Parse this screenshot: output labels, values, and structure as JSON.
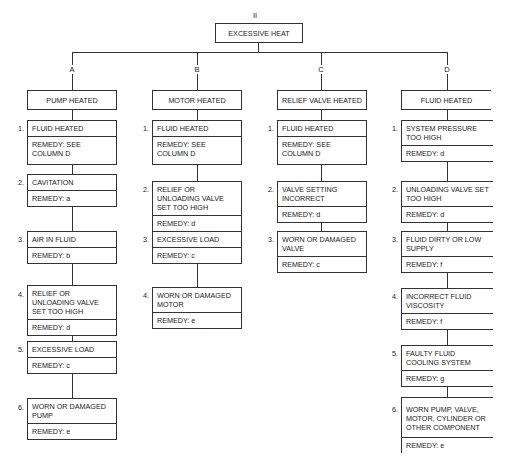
{
  "diagram": {
    "section_number": "II",
    "root": "EXCESSIVE HEAT",
    "columns": [
      {
        "letter": "A",
        "title": "PUMP HEATED",
        "items": [
          {
            "num": "1.",
            "cause": "FLUID HEATED",
            "remedy": "REMEDY: SEE COLUMN D"
          },
          {
            "num": "2.",
            "cause": "CAVITATION",
            "remedy": "REMEDY: a"
          },
          {
            "num": "3.",
            "cause": "AIR IN FLUID",
            "remedy": "REMEDY: b"
          },
          {
            "num": "4.",
            "cause": "RELIEF OR UNLOADING VALVE SET TOO HIGH",
            "remedy": "REMEDY: d"
          },
          {
            "num": "5.",
            "cause": "EXCESSIVE LOAD",
            "remedy": "REMEDY: c"
          },
          {
            "num": "6.",
            "cause": "WORN OR DAMAGED PUMP",
            "remedy": "REMEDY: e"
          }
        ]
      },
      {
        "letter": "B",
        "title": "MOTOR HEATED",
        "items": [
          {
            "num": "1.",
            "cause": "FLUID HEATED",
            "remedy": "REMEDY: SEE COLUMN D"
          },
          {
            "num": "2.",
            "cause": "RELIEF OR UNLOADING VALVE SET TOO HIGH",
            "remedy": "REMEDY: d"
          },
          {
            "num": "3.",
            "cause": "EXCESSIVE LOAD",
            "remedy": "REMEDY: c"
          },
          {
            "num": "4.",
            "cause": "WORN OR DAMAGED MOTOR",
            "remedy": "REMEDY: e"
          }
        ]
      },
      {
        "letter": "C",
        "title": "RELIEF VALVE HEATED",
        "items": [
          {
            "num": "1.",
            "cause": "FLUID HEATED",
            "remedy": "REMEDY: SEE COLUMN D"
          },
          {
            "num": "2.",
            "cause": "VALVE SETTING INCORRECT",
            "remedy": "REMEDY: d"
          },
          {
            "num": "3.",
            "cause": "WORN OR DAMAGED VALVE",
            "remedy": "REMEDY: c"
          }
        ]
      },
      {
        "letter": "D",
        "title": "FLUID HEATED",
        "items": [
          {
            "num": "1.",
            "cause": "SYSTEM PRESSURE TOO HIGH",
            "remedy": "REMEDY: d"
          },
          {
            "num": "2.",
            "cause": "UNLOADING VALVE SET TOO HIGH",
            "remedy": "REMEDY: d"
          },
          {
            "num": "3.",
            "cause": "FLUID DIRTY OR LOW SUPPLY",
            "remedy": "REMEDY: f"
          },
          {
            "num": "4.",
            "cause": "INCORRECT FLUID VISCOSITY",
            "remedy": "REMEDY: f"
          },
          {
            "num": "5.",
            "cause": "FAULTY FLUID COOLING SYSTEM",
            "remedy": "REMEDY: g"
          },
          {
            "num": "6.",
            "cause": "WORN PUMP, VALVE, MOTOR, CYLINDER OR OTHER COMPONENT",
            "remedy": "REMEDY: e"
          }
        ]
      }
    ]
  }
}
